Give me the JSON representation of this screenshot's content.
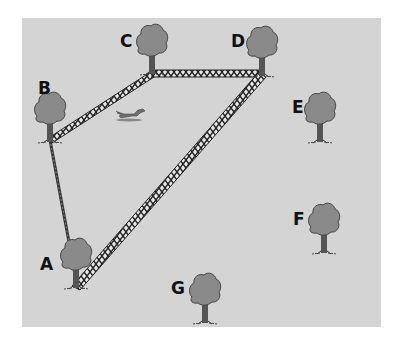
{
  "diagram": {
    "background_color": "#d4d4d4",
    "tree_color": "#8a8a8a",
    "trees": [
      {
        "id": "A",
        "label": "A",
        "label_x": 40,
        "label_y": 256,
        "x": 76,
        "base_y": 288
      },
      {
        "id": "B",
        "label": "B",
        "label_x": 38,
        "label_y": 80,
        "x": 50,
        "base_y": 142
      },
      {
        "id": "C",
        "label": "C",
        "label_x": 120,
        "label_y": 33,
        "x": 152,
        "base_y": 74
      },
      {
        "id": "D",
        "label": "D",
        "label_x": 231,
        "label_y": 33,
        "x": 262,
        "base_y": 76
      },
      {
        "id": "E",
        "label": "E",
        "label_x": 292,
        "label_y": 99,
        "x": 320,
        "base_y": 142
      },
      {
        "id": "F",
        "label": "F",
        "label_x": 293,
        "label_y": 211,
        "x": 324,
        "base_y": 253
      },
      {
        "id": "G",
        "label": "G",
        "label_x": 171,
        "label_y": 280,
        "x": 205,
        "base_y": 323
      }
    ],
    "connections": [
      {
        "from": "A",
        "to": "B",
        "style": "thin-rope"
      },
      {
        "from": "B",
        "to": "C",
        "style": "lattice-fence"
      },
      {
        "from": "C",
        "to": "D",
        "style": "lattice-fence"
      },
      {
        "from": "D",
        "to": "A",
        "style": "lattice-fence"
      }
    ],
    "extra_figure": "running-dog"
  }
}
